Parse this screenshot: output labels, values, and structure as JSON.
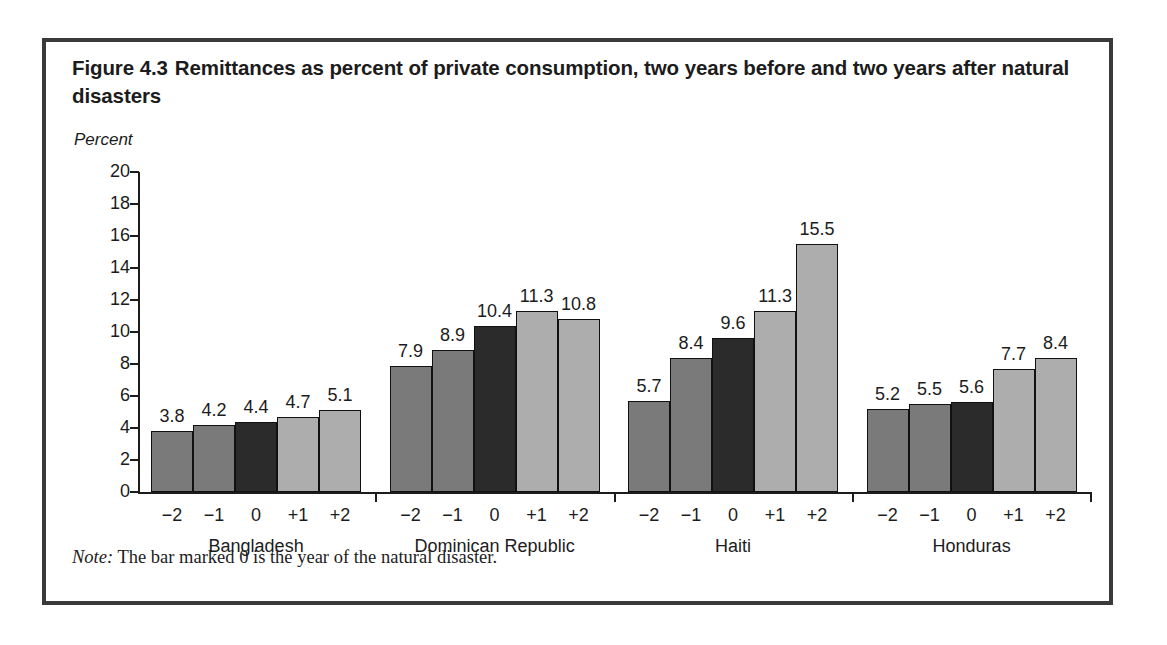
{
  "figure": {
    "number": "Figure 4.3",
    "title": "Remittances as percent of private consumption, two years before and two years after natural disasters",
    "note_lead": "Note:",
    "note_text": " The bar marked 0 is the year of the natural disaster."
  },
  "colors": {
    "frame": "#3a3a3a",
    "text": "#1c1c1c",
    "bar_before": "#7a7a7a",
    "bar_disaster": "#2b2b2b",
    "bar_after": "#adadad",
    "bar_outline": "#111111",
    "axis": "#1c1c1c"
  },
  "chart_data": {
    "type": "bar",
    "xlabel": "",
    "ylabel": "Percent",
    "ylim": [
      0,
      20
    ],
    "yticks": [
      0,
      2,
      4,
      6,
      8,
      10,
      12,
      14,
      16,
      18,
      20
    ],
    "grid": false,
    "legend": "none",
    "categories": [
      "−2",
      "−1",
      "0",
      "+1",
      "+2"
    ],
    "groups": [
      {
        "name": "Bangladesh",
        "values": [
          3.8,
          4.2,
          4.4,
          4.7,
          5.1
        ],
        "labels": [
          "3.8",
          "4.2",
          "4.4",
          "4.7",
          "5.1"
        ]
      },
      {
        "name": "Dominican Republic",
        "values": [
          7.9,
          8.9,
          10.4,
          11.3,
          10.8
        ],
        "labels": [
          "7.9",
          "8.9",
          "10.4",
          "11.3",
          "10.8"
        ]
      },
      {
        "name": "Haiti",
        "values": [
          5.7,
          8.4,
          9.6,
          11.3,
          15.5
        ],
        "labels": [
          "5.7",
          "8.4",
          "9.6",
          "11.3",
          "15.5"
        ]
      },
      {
        "name": "Honduras",
        "values": [
          5.2,
          5.5,
          5.6,
          7.7,
          8.4
        ],
        "labels": [
          "5.2",
          "5.5",
          "5.6",
          "7.7",
          "8.4"
        ]
      }
    ]
  }
}
